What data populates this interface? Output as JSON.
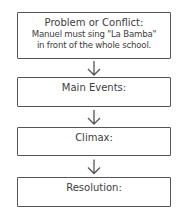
{
  "diagram": {
    "type": "story-map-flowchart",
    "boxes": [
      {
        "title": "Problem or Conflict:",
        "lines": [
          "Manuel must sing \"La Bamba\"",
          "in front of the whole school."
        ]
      },
      {
        "title": "Main Events:"
      },
      {
        "title": "Climax:"
      },
      {
        "title": "Resolution:"
      }
    ],
    "arrows": [
      "down-arrow",
      "down-arrow",
      "down-arrow"
    ],
    "colors": {
      "stroke": "#555555",
      "text": "#3d3d3d",
      "background": "#ffffff"
    }
  }
}
